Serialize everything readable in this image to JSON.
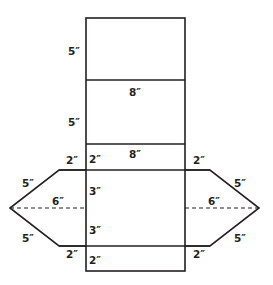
{
  "diagram": {
    "type": "net",
    "colors": {
      "line": "#231f20",
      "background": "#ffffff"
    },
    "labels": {
      "top_panel_height": "5″",
      "second_panel_width": "8″",
      "second_panel_height": "5″",
      "third_panel_width": "8″",
      "third_panel_height": "2″",
      "left_top_edge": "2″",
      "right_top_edge": "2″",
      "left_upper_slant": "5″",
      "right_upper_slant": "5″",
      "left_width": "6″",
      "right_width": "6″",
      "center_upper_half": "3″",
      "center_lower_half": "3″",
      "left_lower_slant": "5″",
      "right_lower_slant": "5″",
      "left_bottom_edge": "2″",
      "right_bottom_edge": "2″",
      "bottom_panel_height": "2″"
    }
  }
}
